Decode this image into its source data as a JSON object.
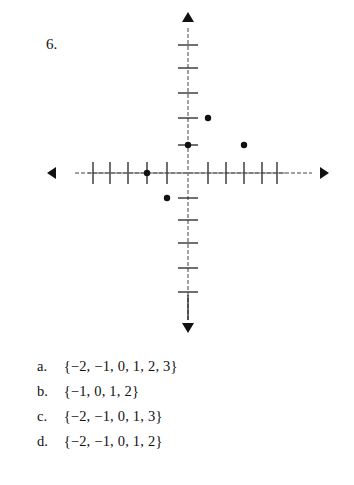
{
  "question": {
    "number": "6."
  },
  "chart_data": {
    "type": "scatter",
    "title": "",
    "xlabel": "",
    "ylabel": "",
    "grid": false,
    "x_ticks": [
      -5,
      -4,
      -3,
      -2,
      -1,
      0,
      1,
      2,
      3,
      4,
      5
    ],
    "y_ticks": [
      -5,
      -4,
      -3,
      -2,
      -1,
      0,
      1,
      2,
      3,
      4,
      5
    ],
    "points": [
      {
        "x": 1,
        "y": 2
      },
      {
        "x": 0,
        "y": 1
      },
      {
        "x": 3,
        "y": 1
      },
      {
        "x": -2,
        "y": 0
      },
      {
        "x": -1,
        "y": -1
      }
    ],
    "axis_arrows": true
  },
  "choices": [
    {
      "label": "a.",
      "set": "{−2, −1, 0, 1, 2, 3}"
    },
    {
      "label": "b.",
      "set": "{−1, 0, 1, 2}"
    },
    {
      "label": "c.",
      "set": "{−2, −1, 0, 1, 3}"
    },
    {
      "label": "d.",
      "set": "{−2, −1, 0, 1, 2}"
    }
  ]
}
